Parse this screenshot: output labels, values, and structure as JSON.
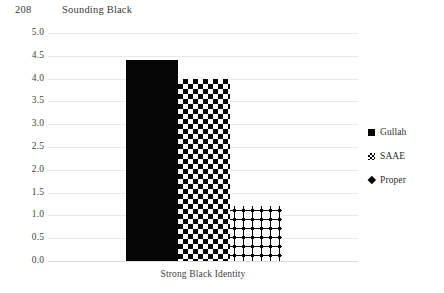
{
  "page": {
    "number": "208",
    "running_head": "Sounding Black"
  },
  "chart_data": {
    "type": "bar",
    "title": "",
    "xlabel": "Strong Black Identity",
    "ylabel": "",
    "categories": [
      "Strong Black Identity"
    ],
    "series": [
      {
        "name": "Gullah",
        "values": [
          4.4
        ],
        "pattern": "solid-black",
        "color": "#050505"
      },
      {
        "name": "SAAE",
        "values": [
          4.0
        ],
        "pattern": "checkerboard",
        "color": "#050505"
      },
      {
        "name": "Proper",
        "values": [
          1.2
        ],
        "pattern": "diamond-grid",
        "color": "#050505"
      }
    ],
    "ylim": [
      0.0,
      5.0
    ],
    "ytick_step": 0.5,
    "yticks": [
      "5.0",
      "4.5",
      "4.0",
      "3.5",
      "3.0",
      "2.5",
      "2.0",
      "1.5",
      "1.0",
      "0.5",
      "0.0"
    ],
    "grid": true,
    "grid_color": "#e9e9e9",
    "legend_position": "right",
    "legend": [
      {
        "label": "Gullah",
        "swatch": "solid-square-icon"
      },
      {
        "label": "SAAE",
        "swatch": "checkered-square-icon"
      },
      {
        "label": "Proper",
        "swatch": "diamond-icon"
      }
    ],
    "background": "#ffffff"
  }
}
